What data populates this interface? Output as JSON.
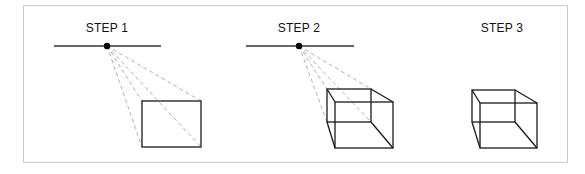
{
  "figure": {
    "steps": [
      {
        "label": "STEP 1",
        "description": "Horizon line with vanishing point and dashed projection lines to front rectangle"
      },
      {
        "label": "STEP 2",
        "description": "Back face drawn along projection lines, edges connected to form box"
      },
      {
        "label": "STEP 3",
        "description": "Finished wireframe box with projection lines removed"
      }
    ],
    "colors": {
      "frame_border": "#c8c8c8",
      "line": "#1a1a1a",
      "dashed_line": "#9a9a9a",
      "vanishing_point": "#000000"
    }
  }
}
